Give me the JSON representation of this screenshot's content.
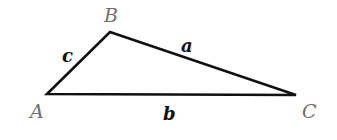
{
  "diagram": {
    "type": "triangle",
    "vertices": [
      {
        "id": "A",
        "label": "A",
        "x": 47,
        "y": 94,
        "label_x": 30,
        "label_y": 118
      },
      {
        "id": "B",
        "label": "B",
        "x": 110,
        "y": 32,
        "label_x": 104,
        "label_y": 22
      },
      {
        "id": "C",
        "label": "C",
        "x": 296,
        "y": 95,
        "label_x": 302,
        "label_y": 118
      }
    ],
    "sides": [
      {
        "id": "a",
        "label": "a",
        "from": "B",
        "to": "C",
        "label_x": 181,
        "label_y": 52
      },
      {
        "id": "b",
        "label": "b",
        "from": "A",
        "to": "C",
        "label_x": 163,
        "label_y": 120
      },
      {
        "id": "c",
        "label": "c",
        "from": "A",
        "to": "B",
        "label_x": 62,
        "label_y": 62
      }
    ],
    "colors": {
      "edge": "#111111",
      "vertex_label": "#6e6e6e",
      "side_label": "#111111"
    }
  }
}
